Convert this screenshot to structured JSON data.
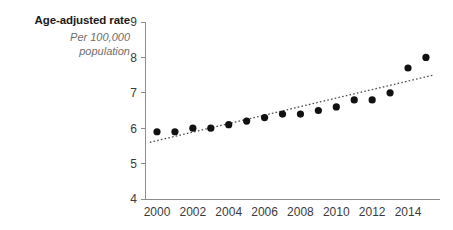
{
  "header": {
    "axis_title": "Age-adjusted rate",
    "subtitle_line1": "Per 100,000",
    "subtitle_line2": "population"
  },
  "colors": {
    "point": "#111111",
    "trend": "#4d4d4d",
    "axis": "#8c8c8c",
    "title": "#1a1a1a",
    "subtitle": "#6e6e6e"
  },
  "chart_data": {
    "type": "scatter",
    "title": "Age-adjusted rate",
    "subtitle": "Per 100,000 population",
    "xlabel": "",
    "ylabel": "Age-adjusted rate, per 100,000 population",
    "xlim": [
      1999.3,
      2015.8
    ],
    "ylim": [
      4,
      9
    ],
    "grid": false,
    "legend": false,
    "y_ticks": [
      4,
      5,
      6,
      7,
      8,
      9
    ],
    "y_tick_labels": [
      "4",
      "5",
      "6",
      "7",
      "8",
      "9"
    ],
    "x_ticks": [
      2000,
      2002,
      2004,
      2006,
      2008,
      2010,
      2012,
      2014
    ],
    "x_tick_labels": [
      "2000",
      "2002",
      "2004",
      "2006",
      "2008",
      "2010",
      "2012",
      "2014"
    ],
    "x": [
      2000,
      2001,
      2002,
      2003,
      2004,
      2005,
      2006,
      2007,
      2008,
      2009,
      2010,
      2011,
      2012,
      2013,
      2014,
      2015
    ],
    "values": [
      5.9,
      5.9,
      6.0,
      6.0,
      6.1,
      6.2,
      6.3,
      6.4,
      6.4,
      6.5,
      6.6,
      6.8,
      6.8,
      7.0,
      7.7,
      8.0
    ],
    "series": [
      {
        "name": "Age-adjusted rate",
        "values": [
          5.9,
          5.9,
          6.0,
          6.0,
          6.1,
          6.2,
          6.3,
          6.4,
          6.4,
          6.5,
          6.6,
          6.8,
          6.8,
          7.0,
          7.7,
          8.0
        ]
      }
    ],
    "trend": {
      "type": "linear-fit",
      "style": "dotted",
      "x_start": 1999.6,
      "y_start": 5.6,
      "x_end": 2015.4,
      "y_end": 7.5
    }
  }
}
